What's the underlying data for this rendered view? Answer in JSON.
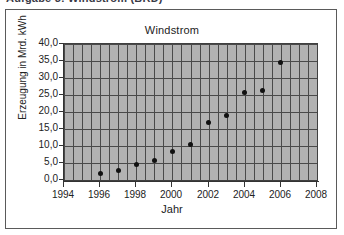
{
  "caption": {
    "text": "Aufgabe 3: Windstrom (BRD)"
  },
  "figure": {
    "title": "Windstrom",
    "frame_color": "#5a5a5a",
    "plot_background": "#b2b2b2",
    "grid_color": "#4a4a4a",
    "marker_color": "#111111"
  },
  "axes": {
    "x": {
      "title": "Jahr",
      "tick_labels": [
        "1994",
        "1996",
        "1998",
        "2000",
        "2002",
        "2004",
        "2006",
        "2008"
      ],
      "tick_values": [
        1994,
        1996,
        1998,
        2000,
        2002,
        2004,
        2006,
        2008
      ],
      "min": 1994,
      "max": 2008,
      "minor_step": 0.5
    },
    "y": {
      "title": "Erzeugung in Mrd. kWh",
      "tick_labels": [
        "40,0",
        "35,0",
        "30,0",
        "25,0",
        "20,0",
        "15,0",
        "10,0",
        "5,0",
        "0,0"
      ],
      "tick_values": [
        40,
        35,
        30,
        25,
        20,
        15,
        10,
        5,
        0
      ],
      "min": 0,
      "max": 40,
      "step": 5
    }
  },
  "chart_data": {
    "type": "scatter",
    "title": "Windstrom",
    "xlabel": "Jahr",
    "ylabel": "Erzeugung in Mrd. kWh",
    "xlim": [
      1994,
      2008
    ],
    "ylim": [
      0,
      40
    ],
    "xticks": [
      1994,
      1996,
      1998,
      2000,
      2002,
      2004,
      2006,
      2008
    ],
    "yticks": [
      0,
      5,
      10,
      15,
      20,
      25,
      30,
      35,
      40
    ],
    "grid": true,
    "legend": false,
    "marker": "filled-circle",
    "x": [
      1996,
      1997,
      1998,
      1999,
      2000,
      2001,
      2002,
      2003,
      2004,
      2005,
      2006
    ],
    "values": [
      1.8,
      2.8,
      4.5,
      5.6,
      8.4,
      10.5,
      16.8,
      19.0,
      25.7,
      26.2,
      34.7
    ],
    "points": [
      {
        "year": 1996,
        "value": 1.8
      },
      {
        "year": 1997,
        "value": 2.8
      },
      {
        "year": 1998,
        "value": 4.5
      },
      {
        "year": 1999,
        "value": 5.6
      },
      {
        "year": 2000,
        "value": 8.4
      },
      {
        "year": 2001,
        "value": 10.5
      },
      {
        "year": 2002,
        "value": 16.8
      },
      {
        "year": 2003,
        "value": 19.0
      },
      {
        "year": 2004,
        "value": 25.7
      },
      {
        "year": 2005,
        "value": 26.2
      },
      {
        "year": 2006,
        "value": 34.7
      }
    ]
  }
}
